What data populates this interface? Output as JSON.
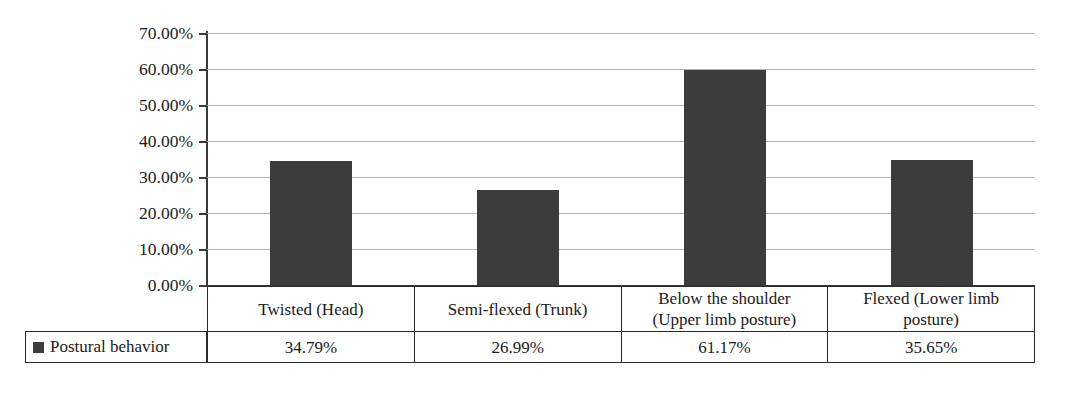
{
  "chart_data": {
    "type": "bar",
    "title": "",
    "xlabel": "",
    "ylabel": "",
    "categories": [
      "Twisted (Head)",
      "Semi-flexed (Trunk)",
      "Below the shoulder (Upper limb posture)",
      "Flexed (Lower limb posture)"
    ],
    "category_lines": [
      [
        "Twisted (Head)",
        ""
      ],
      [
        "Semi-flexed (Trunk)",
        ""
      ],
      [
        "Below the shoulder",
        "(Upper limb posture)"
      ],
      [
        "Flexed (Lower limb",
        "posture)"
      ]
    ],
    "series": [
      {
        "name": "Postural behavior",
        "values": [
          34.79,
          26.99,
          61.17,
          35.65
        ],
        "value_labels": [
          "34.79%",
          "26.99%",
          "61.17%",
          "35.65%"
        ],
        "plotted_values": [
          34.5,
          26.4,
          59.8,
          34.6
        ],
        "color": "#3c3c3c"
      }
    ],
    "ylim": [
      0,
      70
    ],
    "ytick_values": [
      0,
      10,
      20,
      30,
      40,
      50,
      60,
      70
    ],
    "ytick_labels": [
      "70.00%",
      "60.00%",
      "50.00%",
      "40.00%",
      "30.00%",
      "20.00%",
      "10.00%",
      "0.00%"
    ],
    "grid": true,
    "legend_position": "table-left"
  },
  "legend": {
    "label": "Postural behavior",
    "swatch_color": "#3c3c3c"
  },
  "colors": {
    "bar": "#3c3c3c",
    "gridline": "#b4b4b4",
    "axis": "#3a3a3a",
    "table_border": "#2a2a2a",
    "background": "#ffffff"
  }
}
